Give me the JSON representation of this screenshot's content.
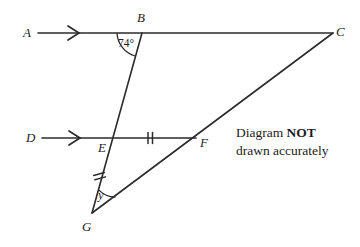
{
  "diagram": {
    "type": "geometry-figure",
    "background_color": "#ffffff",
    "stroke_color": "#2b2b2b",
    "label_color": "#1d1d1d",
    "points": {
      "A": {
        "label": "A",
        "x": 27,
        "y": 33
      },
      "B": {
        "label": "B",
        "x": 141,
        "y": 18
      },
      "C": {
        "label": "C",
        "x": 340,
        "y": 32
      },
      "D": {
        "label": "D",
        "x": 30,
        "y": 138
      },
      "E": {
        "label": "E",
        "x": 101,
        "y": 148
      },
      "F": {
        "label": "F",
        "x": 203,
        "y": 143
      },
      "G": {
        "label": "G",
        "x": 85,
        "y": 228
      }
    },
    "vertices": {
      "A": {
        "x": 38,
        "y": 33
      },
      "B": {
        "x": 142,
        "y": 33
      },
      "C": {
        "x": 333,
        "y": 33
      },
      "D": {
        "x": 42,
        "y": 138
      },
      "E": {
        "x": 107,
        "y": 138
      },
      "F": {
        "x": 196,
        "y": 138
      },
      "G": {
        "x": 92,
        "y": 213
      }
    },
    "segments": [
      {
        "name": "line-AC",
        "from": "A",
        "to": "C",
        "description": "top horizontal line through B"
      },
      {
        "name": "line-DF",
        "from": "D",
        "to": "F",
        "description": "lower horizontal line through E"
      },
      {
        "name": "line-BG",
        "from": "B",
        "to": "G",
        "description": "transversal through E"
      },
      {
        "name": "line-GC",
        "from": "G",
        "to": "C",
        "description": "diagonal through F"
      }
    ],
    "parallel_arrows": [
      {
        "name": "arrow-marker-AB",
        "x": 74,
        "y": 33
      },
      {
        "name": "arrow-marker-DE",
        "x": 75,
        "y": 138
      }
    ],
    "tick_marks": [
      {
        "name": "tick-EF",
        "segment": "EF",
        "count": 2,
        "x": 150,
        "y": 138,
        "angle_deg": 0
      },
      {
        "name": "tick-EG",
        "segment": "EG",
        "count": 2,
        "x": 99,
        "y": 174,
        "angle_deg": 11
      }
    ],
    "angles": [
      {
        "name": "angle-at-B",
        "vertex": "B",
        "label": "74°",
        "label_x": 119,
        "label_y": 38,
        "arc_radius": 25,
        "start_deg": 180,
        "end_deg": 252
      },
      {
        "name": "angle-at-G",
        "vertex": "G",
        "label": "y",
        "label_x": 98,
        "label_y": 188,
        "arc_radius": 24,
        "start_deg": -55,
        "end_deg": -11
      }
    ]
  },
  "note": {
    "line1_prefix": "Diagram ",
    "line1_strong": "NOT",
    "line2": "drawn accurately"
  }
}
